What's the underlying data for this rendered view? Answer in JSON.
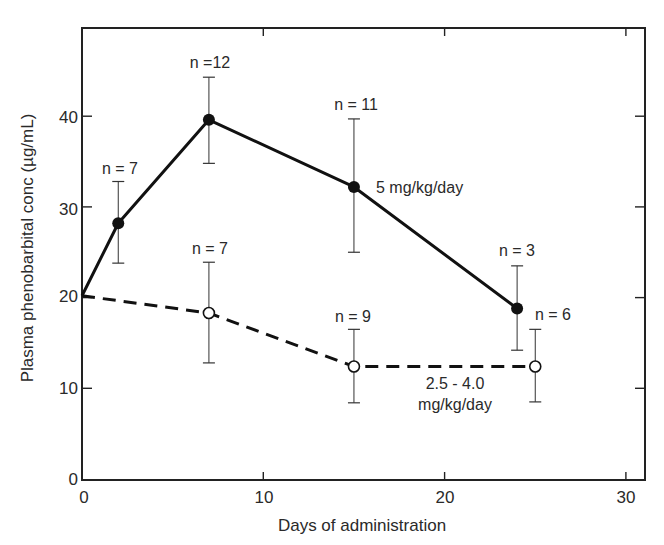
{
  "chart_data": {
    "type": "line",
    "title": "",
    "xlabel": "Days of administration",
    "ylabel": "Plasma phenobarbital conc (µg/mL)",
    "xlim": [
      0,
      31
    ],
    "ylim": [
      0,
      50
    ],
    "xticks": [
      0,
      10,
      20,
      30
    ],
    "yticks": [
      0,
      10,
      20,
      30,
      40
    ],
    "grid": false,
    "legend": "inline labels",
    "series": [
      {
        "name": "5 mg/kg/day",
        "style": "solid",
        "marker": "filled-circle",
        "x": [
          0,
          2,
          7,
          15,
          24
        ],
        "y": [
          20.2,
          28.2,
          39.6,
          32.2,
          18.8
        ],
        "err_low": [
          null,
          23.8,
          34.8,
          25.0,
          14.2
        ],
        "err_high": [
          null,
          32.8,
          44.3,
          39.7,
          23.5
        ],
        "n": [
          null,
          7,
          12,
          11,
          3
        ]
      },
      {
        "name": "2.5 - 4.0 mg/kg/day",
        "style": "dashed",
        "marker": "open-circle",
        "x": [
          0,
          7,
          15,
          25
        ],
        "y": [
          20.2,
          18.3,
          12.4,
          12.4
        ],
        "err_low": [
          null,
          12.8,
          8.4,
          8.5
        ],
        "err_high": [
          null,
          23.9,
          16.5,
          16.5
        ],
        "n": [
          null,
          7,
          9,
          6
        ]
      }
    ],
    "annotations": [
      {
        "text": "n = 7",
        "series": 0,
        "point": 1
      },
      {
        "text": "n =12",
        "series": 0,
        "point": 2
      },
      {
        "text": "n = 11",
        "series": 0,
        "point": 3
      },
      {
        "text": "n = 3",
        "series": 0,
        "point": 4
      },
      {
        "text": "n = 7",
        "series": 1,
        "point": 1
      },
      {
        "text": "n = 9",
        "series": 1,
        "point": 2
      },
      {
        "text": "n = 6",
        "series": 1,
        "point": 3
      },
      {
        "text": "5 mg/kg/day",
        "series": 0,
        "label": true
      },
      {
        "text": "2.5 - 4.0",
        "series": 1,
        "label": true
      },
      {
        "text": "mg/kg/day",
        "series": 1,
        "label": true
      }
    ]
  },
  "labels": {
    "x_axis_title": "Days of administration",
    "y_axis_title": "Plasma phenobarbital conc (µg/mL)",
    "x_ticks": [
      "0",
      "10",
      "20",
      "30"
    ],
    "y_ticks": [
      "0",
      "10",
      "20",
      "30",
      "40"
    ],
    "series1_label": "5 mg/kg/day",
    "series2_label_line1": "2.5 - 4.0",
    "series2_label_line2": "mg/kg/day",
    "n_labels": {
      "s1_p1": "n = 7",
      "s1_p2": "n =12",
      "s1_p3": "n = 11",
      "s1_p4": "n = 3",
      "s2_p1": "n = 7",
      "s2_p2": "n = 9",
      "s2_p3": "n = 6"
    }
  }
}
